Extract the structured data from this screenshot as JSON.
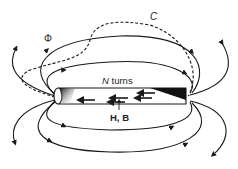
{
  "diagram": {
    "labels": {
      "flux": "Φ",
      "contour": "C",
      "turns_var": "N",
      "turns_text": " turns",
      "field": "H, B"
    },
    "elements": [
      {
        "name": "rod",
        "description": "cylindrical bar with shaded ends"
      },
      {
        "name": "internal-field-arrows",
        "count": 5,
        "direction": "left"
      },
      {
        "name": "field-lines",
        "count": 8,
        "style": "solid with arrowheads, closing outside rod"
      },
      {
        "name": "contour-c",
        "style": "dashed closed path threading through rod"
      }
    ],
    "colors": {
      "line": "#1a1a1a",
      "background": "#ffffff"
    }
  }
}
